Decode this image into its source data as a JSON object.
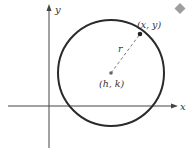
{
  "figure": {
    "axes": {
      "x_label": "x",
      "y_label": "y"
    },
    "circle": {
      "center_label": "(h, k)",
      "point_label": "(x, y)",
      "radius_label": "r",
      "stroke_color": "#2a2a2a"
    },
    "marker": {
      "icon": "diamond-icon",
      "color": "#9e9e9e"
    }
  }
}
